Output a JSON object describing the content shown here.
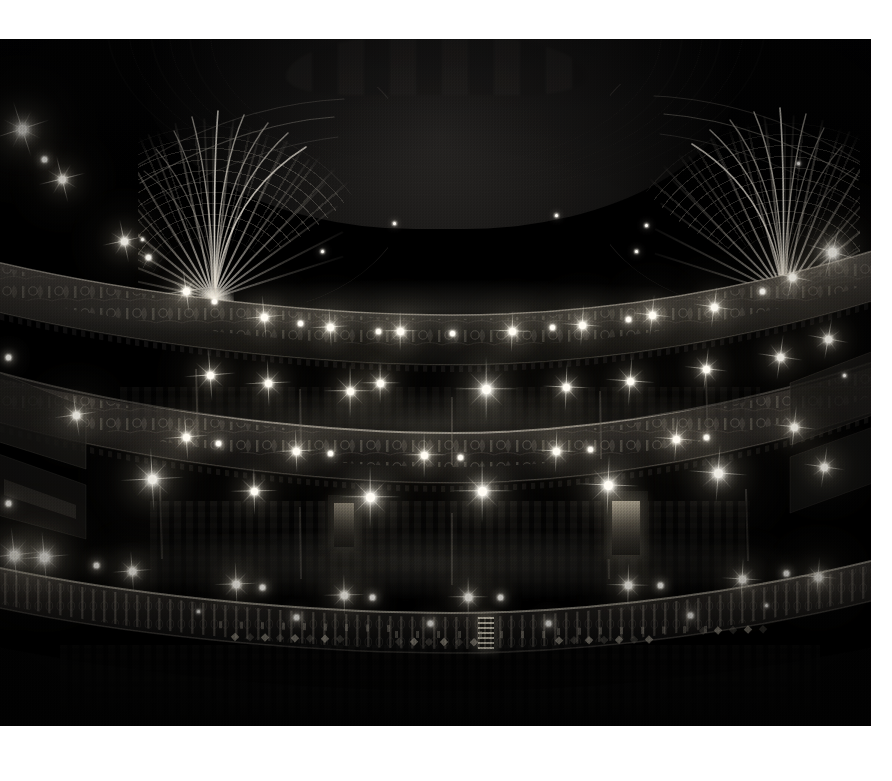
{
  "document": {
    "type": "photograph",
    "medium": "black-and-white photograph",
    "subject": "Ornate Victorian theatre auditorium interior viewed from the stage",
    "orientation": "landscape",
    "background_color": "#ffffff",
    "plate_color": "#000000"
  },
  "plate": {
    "left": 0,
    "top": 39,
    "width": 871,
    "height": 687
  },
  "scene": {
    "title": "Theatre auditorium interior",
    "description": "Three curved balcony tiers rise around a darkened auditorium. Ornamental plaster fan-vaults spring from each side of the ceiling. Dozens of small incandescent lamps burn along the balcony fronts, each flaring into a star of diffraction spikes.",
    "lighting": "house lights only; long exposure",
    "elements": [
      {
        "name": "ceiling-dome",
        "label": "Coffered ceiling dome"
      },
      {
        "name": "fan-vault-left",
        "label": "Left fan vault pendentive"
      },
      {
        "name": "fan-vault-right",
        "label": "Right fan vault pendentive"
      },
      {
        "name": "upper-gallery",
        "label": "Upper gallery (balcony)"
      },
      {
        "name": "grand-circle",
        "label": "Grand circle"
      },
      {
        "name": "dress-circle",
        "label": "Dress circle"
      },
      {
        "name": "stalls",
        "label": "Orchestra stalls"
      },
      {
        "name": "side-boxes-left",
        "label": "Left side boxes"
      },
      {
        "name": "side-boxes-right",
        "label": "Right side boxes"
      },
      {
        "name": "exit-doorway",
        "label": "Lit exit doorway at rear of stalls"
      }
    ]
  },
  "tones": {
    "highlight": "#fffdf7",
    "lamp_warm": "#fff3d6",
    "plaster_mid": "#a8a094",
    "shadow": "#0a0a0a",
    "black": "#000000",
    "paper": "#ffffff"
  },
  "lights": {
    "count_visible": 78,
    "description": "Small glass globes along balcony fronts and box fronts"
  }
}
